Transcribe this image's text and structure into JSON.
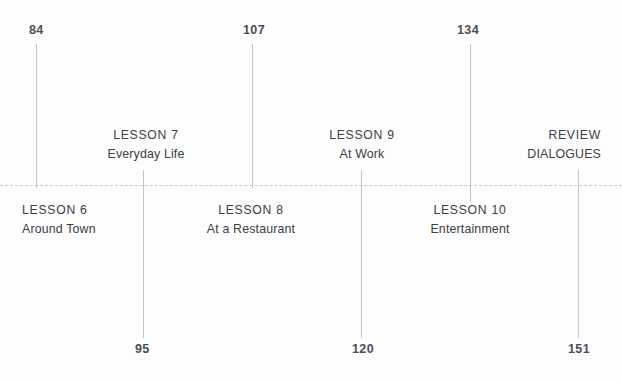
{
  "timeline": {
    "baseline": {
      "style": "dashed",
      "color": "#c9cccf",
      "y": 185
    },
    "tick_color": "#c2c5c8",
    "ticks": [
      {
        "id": "tick-84",
        "x": 36,
        "y_top": 44,
        "y_bottom": 188
      },
      {
        "id": "tick-95",
        "x": 143,
        "y_top": 170,
        "y_bottom": 338
      },
      {
        "id": "tick-107",
        "x": 252,
        "y_top": 44,
        "y_bottom": 188
      },
      {
        "id": "tick-120",
        "x": 361,
        "y_top": 170,
        "y_bottom": 338
      },
      {
        "id": "tick-134",
        "x": 470,
        "y_top": 44,
        "y_bottom": 202
      },
      {
        "id": "tick-151",
        "x": 578,
        "y_top": 170,
        "y_bottom": 338
      }
    ],
    "page_numbers": [
      {
        "id": "page-84",
        "value": "84",
        "x": 29,
        "y": 23,
        "align": "left"
      },
      {
        "id": "page-107",
        "value": "107",
        "x": 243,
        "y": 23,
        "align": "left"
      },
      {
        "id": "page-134",
        "value": "134",
        "x": 457,
        "y": 23,
        "align": "left"
      },
      {
        "id": "page-95",
        "value": "95",
        "x": 135,
        "y": 342,
        "align": "left"
      },
      {
        "id": "page-120",
        "value": "120",
        "x": 352,
        "y": 342,
        "align": "left"
      },
      {
        "id": "page-151",
        "value": "151",
        "x": 568,
        "y": 342,
        "align": "left"
      }
    ],
    "entries": [
      {
        "id": "lesson-6",
        "title": "LESSON 6",
        "subtitle": "Around Town",
        "position": "below",
        "align": "left",
        "x": 22,
        "y": 201
      },
      {
        "id": "lesson-7",
        "title": "LESSON 7",
        "subtitle": "Everyday Life",
        "position": "above",
        "align": "center",
        "x": 146,
        "y": 126
      },
      {
        "id": "lesson-8",
        "title": "LESSON 8",
        "subtitle": "At a Restaurant",
        "position": "below",
        "align": "center",
        "x": 251,
        "y": 201
      },
      {
        "id": "lesson-9",
        "title": "LESSON 9",
        "subtitle": "At Work",
        "position": "above",
        "align": "center",
        "x": 362,
        "y": 126
      },
      {
        "id": "lesson-10",
        "title": "LESSON 10",
        "subtitle": "Entertainment",
        "position": "below",
        "align": "center",
        "x": 470,
        "y": 201
      },
      {
        "id": "review-dialogues",
        "title": "REVIEW",
        "subtitle": "DIALOGUES",
        "position": "above",
        "align": "right",
        "x": 601,
        "y": 126
      }
    ]
  }
}
